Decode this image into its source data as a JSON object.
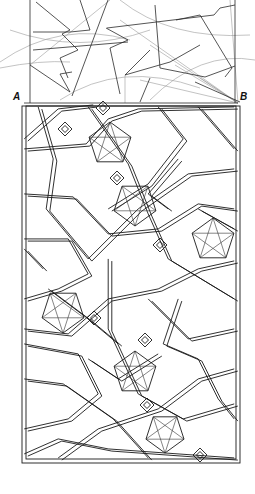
{
  "diagram": {
    "type": "islamic-geometric-lattice-construction",
    "labels": {
      "a": "A",
      "b": "B"
    },
    "colors": {
      "ink": "#1a1a1a",
      "construction": "#9a9a9a",
      "background": "#ffffff"
    },
    "construction": {
      "region": [
        0,
        0,
        255,
        105
      ],
      "baseline": {
        "from": [
          24,
          103
        ],
        "to": [
          238,
          103
        ]
      }
    },
    "frame": {
      "outer": [
        22,
        106,
        240,
        463
      ],
      "inner": [
        26,
        106,
        236,
        459
      ]
    },
    "star_rosettes": [
      {
        "cx": 110,
        "cy": 144,
        "r": 22
      },
      {
        "cx": 135,
        "cy": 204,
        "r": 22
      },
      {
        "cx": 213,
        "cy": 240,
        "r": 22
      },
      {
        "cx": 63,
        "cy": 311,
        "r": 22
      },
      {
        "cx": 135,
        "cy": 373,
        "r": 22
      },
      {
        "cx": 165,
        "cy": 433,
        "r": 20
      }
    ],
    "small_diamonds": [
      {
        "cx": 65,
        "cy": 129
      },
      {
        "cx": 117,
        "cy": 178
      },
      {
        "cx": 160,
        "cy": 245
      },
      {
        "cx": 94,
        "cy": 318
      },
      {
        "cx": 147,
        "cy": 405
      },
      {
        "cx": 200,
        "cy": 455
      },
      {
        "cx": 103,
        "cy": 108
      },
      {
        "cx": 145,
        "cy": 340
      }
    ]
  }
}
